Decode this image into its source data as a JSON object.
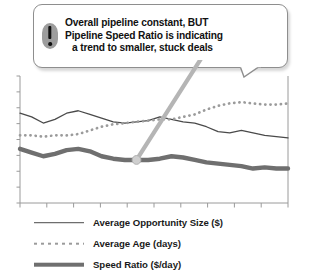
{
  "callout": {
    "icon": "exclamation-icon",
    "lines": [
      "Overall pipeline constant, BUT",
      "Pipeline Speed Ratio is indicating",
      "a trend to smaller, stuck deals"
    ]
  },
  "legend": {
    "items": [
      {
        "label": "Average Opportunity Size ($)",
        "style": "solid-thin",
        "color": "#4a4a4a"
      },
      {
        "label": "Average Age (days)",
        "style": "dotted",
        "color": "#9b9b9b"
      },
      {
        "label": "Speed Ratio ($/day)",
        "style": "solid-thick",
        "color": "#6f6f6f"
      }
    ]
  },
  "colors": {
    "axis": "#9a9a9a",
    "opportunity_size": "#4a4a4a",
    "average_age": "#9b9b9b",
    "speed_ratio": "#6f6f6f",
    "pointer": "#b5b5b5",
    "background": "#ffffff"
  },
  "chart_data": {
    "type": "line",
    "title": "",
    "subtitle": "",
    "xlabel": "",
    "ylabel": "",
    "grid": false,
    "legend_position": "bottom-left",
    "xlim": [
      0,
      23
    ],
    "ylim": [
      0,
      100
    ],
    "x_tick_count": 10,
    "y_tick_count": 8,
    "x": [
      0,
      1,
      2,
      3,
      4,
      5,
      6,
      7,
      8,
      9,
      10,
      11,
      12,
      13,
      14,
      15,
      16,
      17,
      18,
      19,
      20,
      21,
      22,
      23
    ],
    "series": [
      {
        "name": "Average Opportunity Size ($)",
        "style": "solid-thin",
        "color": "#4a4a4a",
        "values": [
          73,
          70,
          65,
          68,
          73,
          75,
          72,
          69,
          66,
          65,
          66,
          67,
          70,
          68,
          66,
          65,
          62,
          58,
          57,
          59,
          57,
          55,
          54,
          53
        ]
      },
      {
        "name": "Average Age (days)",
        "style": "dotted",
        "color": "#9b9b9b",
        "values": [
          55,
          55,
          54,
          55,
          55,
          56,
          59,
          62,
          64,
          65,
          66,
          67,
          68,
          68,
          70,
          72,
          76,
          79,
          81,
          82,
          81,
          80,
          80,
          81
        ]
      },
      {
        "name": "Speed Ratio ($/day)",
        "style": "solid-thick",
        "color": "#6f6f6f",
        "values": [
          44,
          41,
          38,
          40,
          43,
          44,
          42,
          38,
          36,
          35,
          35,
          35,
          36,
          38,
          37,
          35,
          33,
          32,
          31,
          30,
          28,
          29,
          28,
          28
        ]
      }
    ],
    "annotation": {
      "text": "Overall pipeline constant, BUT Pipeline Speed Ratio is indicating a trend to smaller, stuck deals",
      "points_to_series": "Speed Ratio ($/day)",
      "points_to_x": 10
    }
  }
}
